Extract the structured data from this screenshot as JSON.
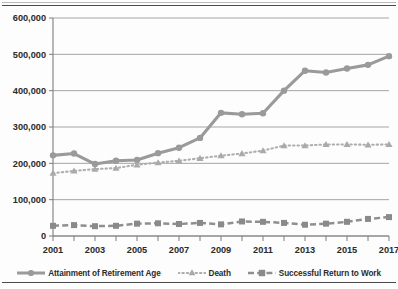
{
  "chart_data": {
    "type": "line",
    "title": "",
    "subtitle": "",
    "xlabel": "",
    "ylabel": "",
    "x": [
      2001,
      2002,
      2003,
      2004,
      2005,
      2006,
      2007,
      2008,
      2009,
      2010,
      2011,
      2012,
      2013,
      2014,
      2015,
      2016,
      2017
    ],
    "categories": [
      "2001",
      "2002",
      "2003",
      "2004",
      "2005",
      "2006",
      "2007",
      "2008",
      "2009",
      "2010",
      "2011",
      "2012",
      "2013",
      "2014",
      "2015",
      "2016",
      "2017"
    ],
    "xtick_labels": [
      "2001",
      "",
      "2003",
      "",
      "2005",
      "",
      "2007",
      "",
      "2009",
      "",
      "2011",
      "",
      "2013",
      "",
      "2015",
      "",
      "2017"
    ],
    "ytick_labels": [
      "0",
      "100,000",
      "200,000",
      "300,000",
      "400,000",
      "500,000",
      "600,000"
    ],
    "ytick_values": [
      0,
      100000,
      200000,
      300000,
      400000,
      500000,
      600000
    ],
    "ylim": [
      0,
      600000
    ],
    "xlim": [
      2001,
      2017
    ],
    "grid": true,
    "grid_axis": "y",
    "legend_position": "bottom",
    "series": [
      {
        "name": "Attainment of Retirement Age",
        "marker": "circle",
        "linestyle": "solid",
        "color": "#9a9a9a",
        "values": [
          222000,
          227000,
          198000,
          207000,
          209000,
          228000,
          243000,
          270000,
          339000,
          335000,
          338000,
          400000,
          455000,
          450000,
          461000,
          471000,
          495000
        ]
      },
      {
        "name": "Death",
        "marker": "triangle",
        "linestyle": "dotted",
        "color": "#aeaeae",
        "values": [
          173000,
          179000,
          184000,
          187000,
          196000,
          202000,
          207000,
          214000,
          221000,
          227000,
          235000,
          249000,
          249000,
          252000,
          252000,
          251000,
          252000
        ]
      },
      {
        "name": "Successful Return to Work",
        "marker": "square",
        "linestyle": "dashed",
        "color": "#8f8f8f",
        "values": [
          28000,
          30000,
          27000,
          28000,
          34000,
          35000,
          33000,
          36000,
          32000,
          40000,
          39000,
          36000,
          31000,
          34000,
          39000,
          47000,
          52000
        ]
      }
    ]
  },
  "legend": {
    "items": [
      {
        "label": "Attainment of Retirement Age",
        "marker": "circle-line-marker",
        "color": "#9a9a9a"
      },
      {
        "label": "Death",
        "marker": "triangle-dotted-marker",
        "color": "#aeaeae"
      },
      {
        "label": "Successful Return to Work",
        "marker": "square-dashed-marker",
        "color": "#8f8f8f"
      }
    ]
  }
}
